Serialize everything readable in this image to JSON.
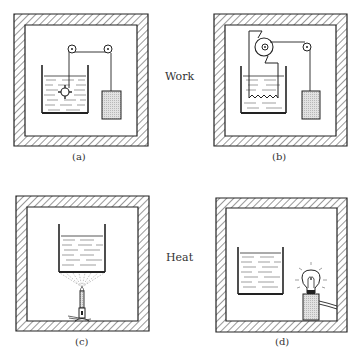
{
  "figure": {
    "row_labels": {
      "top": "Work",
      "bottom": "Heat"
    },
    "panels": [
      {
        "id": "a",
        "caption": "(a)",
        "description": "Insulated box; beaker of liquid with paddle wheel driven by falling weight via two pulleys"
      },
      {
        "id": "b",
        "caption": "(b)",
        "description": "Insulated box; beaker of liquid with resistor heated by generator driven by falling weight via pulley"
      },
      {
        "id": "c",
        "caption": "(c)",
        "description": "Insulated box; beaker of liquid heated by Bunsen burner flame"
      },
      {
        "id": "d",
        "caption": "(d)",
        "description": "Insulated box; beaker of liquid near glowing light bulb on a base with cord"
      }
    ],
    "colors": {
      "line": "#222222",
      "hatch": "#333333",
      "fill_weight": "#cfcfcf",
      "background": "#ffffff"
    }
  }
}
